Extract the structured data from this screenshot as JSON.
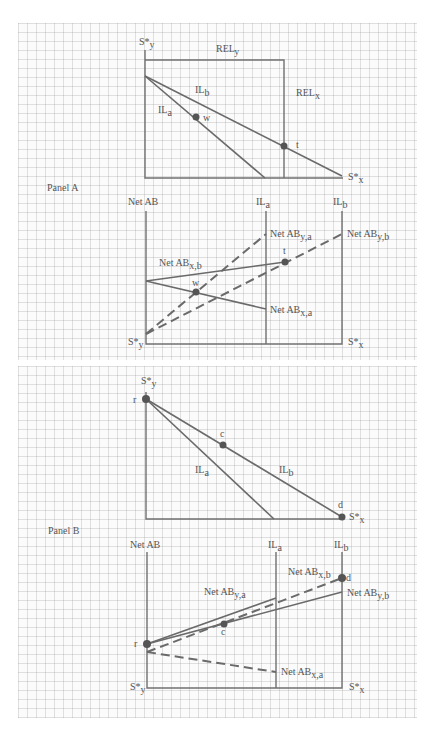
{
  "panels": {
    "a": {
      "label": "Panel A",
      "top_chart": {
        "y_axis": "S*",
        "y_axis_sub": "y",
        "x_axis": "S*",
        "x_axis_sub": "x",
        "rel_y": "REL",
        "rel_y_sub": "y",
        "rel_x": "REL",
        "rel_x_sub": "x",
        "line_b": "IL",
        "line_b_sub": "b",
        "line_a": "IL",
        "line_a_sub": "a",
        "point_w": "w",
        "point_t": "t"
      },
      "bottom_chart": {
        "y_axis": "Net AB",
        "origin_y": "S*",
        "origin_y_sub": "y",
        "x_axis": "S*",
        "x_axis_sub": "x",
        "col_a": "IL",
        "col_a_sub": "a",
        "col_b": "IL",
        "col_b_sub": "b",
        "net_y_a": "Net AB",
        "net_y_a_sub": "y,a",
        "net_y_b": "Net AB",
        "net_y_b_sub": "y,b",
        "net_x_b": "Net AB",
        "net_x_b_sub": "x,b",
        "net_x_a": "Net AB",
        "net_x_a_sub": "x,a",
        "point_w": "w",
        "point_t": "t"
      }
    },
    "b": {
      "label": "Panel B",
      "top_chart": {
        "y_axis": "S*",
        "y_axis_sub": "y",
        "x_axis": "S*",
        "x_axis_sub": "x",
        "line_a": "IL",
        "line_a_sub": "a",
        "line_b": "IL",
        "line_b_sub": "b",
        "point_r": "r",
        "point_c": "c",
        "point_d": "d"
      },
      "bottom_chart": {
        "y_axis": "Net AB",
        "origin_y": "S*",
        "origin_y_sub": "y",
        "x_axis": "S*",
        "x_axis_sub": "x",
        "col_a": "IL",
        "col_a_sub": "a",
        "col_b": "IL",
        "col_b_sub": "b",
        "net_y_a": "Net AB",
        "net_y_a_sub": "y,a",
        "net_x_b_top": "Net AB",
        "net_x_b_top_sub": "x,b",
        "net_y_b": "Net AB",
        "net_y_b_sub": "y,b",
        "net_x_a": "Net AB",
        "net_x_a_sub": "x,a",
        "point_r": "r",
        "point_c": "c",
        "point_d": "d"
      }
    }
  },
  "colors": {
    "line": "#6a6a6a",
    "grid": "#c8c8c8",
    "text": "#555555"
  }
}
